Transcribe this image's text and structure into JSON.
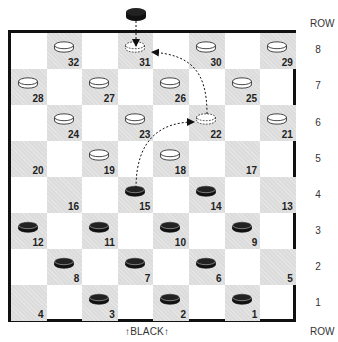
{
  "diagram": {
    "type": "checkerboard",
    "header_row_label": "ROW",
    "footer_row_label": "ROW",
    "bottom_label": "↑BLACK↑",
    "row_numbers": [
      "8",
      "7",
      "6",
      "5",
      "4",
      "3",
      "2",
      "1"
    ],
    "colors": {
      "dark_square": "#dcdcdc",
      "light_square": "#ffffff",
      "border": "#111111",
      "black_piece": "#111111",
      "white_piece": "#ffffff"
    },
    "squares": [
      {
        "num": "32",
        "row": 8,
        "col": 2,
        "piece": "white"
      },
      {
        "num": "31",
        "row": 8,
        "col": 4,
        "piece": "ghost"
      },
      {
        "num": "30",
        "row": 8,
        "col": 6,
        "piece": "white"
      },
      {
        "num": "29",
        "row": 8,
        "col": 8,
        "piece": "white"
      },
      {
        "num": "28",
        "row": 7,
        "col": 1,
        "piece": "white"
      },
      {
        "num": "27",
        "row": 7,
        "col": 3,
        "piece": "white"
      },
      {
        "num": "26",
        "row": 7,
        "col": 5,
        "piece": "white"
      },
      {
        "num": "25",
        "row": 7,
        "col": 7,
        "piece": "white"
      },
      {
        "num": "24",
        "row": 6,
        "col": 2,
        "piece": "white"
      },
      {
        "num": "23",
        "row": 6,
        "col": 4,
        "piece": "white"
      },
      {
        "num": "22",
        "row": 6,
        "col": 6,
        "piece": "ghost"
      },
      {
        "num": "21",
        "row": 6,
        "col": 8,
        "piece": "white"
      },
      {
        "num": "20",
        "row": 5,
        "col": 1,
        "piece": ""
      },
      {
        "num": "19",
        "row": 5,
        "col": 3,
        "piece": "white"
      },
      {
        "num": "18",
        "row": 5,
        "col": 5,
        "piece": "white"
      },
      {
        "num": "17",
        "row": 5,
        "col": 7,
        "piece": ""
      },
      {
        "num": "16",
        "row": 4,
        "col": 2,
        "piece": ""
      },
      {
        "num": "15",
        "row": 4,
        "col": 4,
        "piece": "black"
      },
      {
        "num": "14",
        "row": 4,
        "col": 6,
        "piece": "black"
      },
      {
        "num": "13",
        "row": 4,
        "col": 8,
        "piece": ""
      },
      {
        "num": "12",
        "row": 3,
        "col": 1,
        "piece": "black"
      },
      {
        "num": "11",
        "row": 3,
        "col": 3,
        "piece": "black"
      },
      {
        "num": "10",
        "row": 3,
        "col": 5,
        "piece": "black"
      },
      {
        "num": "9",
        "row": 3,
        "col": 7,
        "piece": "black"
      },
      {
        "num": "8",
        "row": 2,
        "col": 2,
        "piece": "black"
      },
      {
        "num": "7",
        "row": 2,
        "col": 4,
        "piece": "black"
      },
      {
        "num": "6",
        "row": 2,
        "col": 6,
        "piece": "black"
      },
      {
        "num": "5",
        "row": 2,
        "col": 8,
        "piece": ""
      },
      {
        "num": "4",
        "row": 1,
        "col": 1,
        "piece": ""
      },
      {
        "num": "3",
        "row": 1,
        "col": 3,
        "piece": "black"
      },
      {
        "num": "2",
        "row": 1,
        "col": 5,
        "piece": "black"
      },
      {
        "num": "1",
        "row": 1,
        "col": 7,
        "piece": "black"
      }
    ],
    "annotations": [
      {
        "type": "piece-entering",
        "piece": "black",
        "target": "31",
        "description": "black piece above board with arrow down to square 31"
      },
      {
        "type": "jump-arrow",
        "from": "15",
        "to": "22",
        "style": "dotted"
      },
      {
        "type": "jump-arrow",
        "from": "22",
        "to": "31",
        "style": "dotted"
      }
    ]
  }
}
